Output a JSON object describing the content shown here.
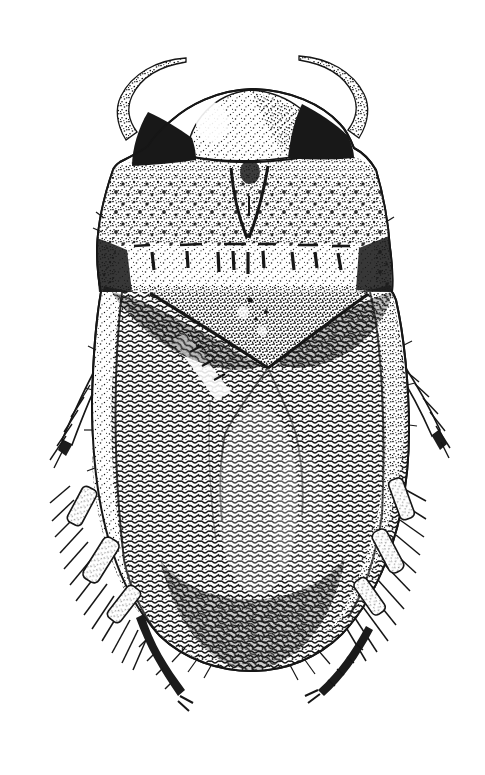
{
  "illustration": {
    "type": "stipple-ink-drawing",
    "subject": "aquatic bug (Hemiptera), dorsal view",
    "view": "dorsal",
    "ink_color": "#161616",
    "paper_color": "#ffffff",
    "title": "Ink stipple illustration of an aquatic bug, dorsal view",
    "alt": "Black-and-white stippled scientific illustration of a broadly oval aquatic bug seen from above: domed stippled head with black eyes, curved antennae, pale banded pronotum, dark stippled wing covers, and hair-fringed hind swimming legs ending in clawed tarsi."
  }
}
